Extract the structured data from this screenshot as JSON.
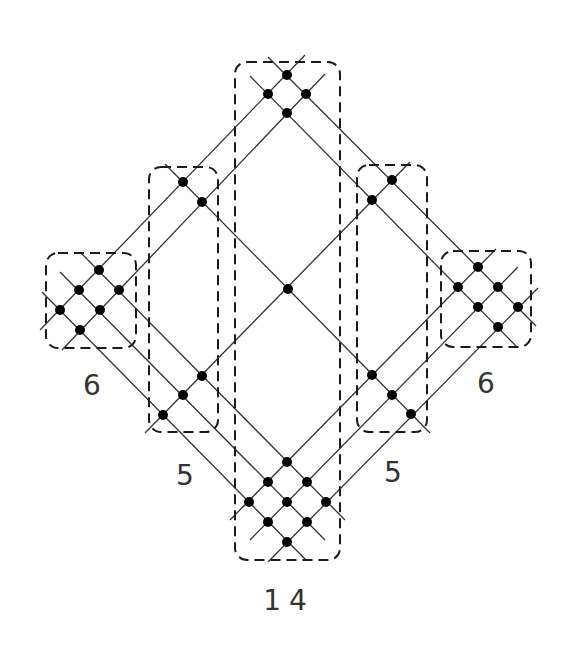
{
  "diagram": {
    "type": "dot-lattice-grouping",
    "colors": {
      "line": "#333333",
      "dot": "#000000",
      "box": "#1a1a1a",
      "label": "#333333",
      "background": "#ffffff"
    },
    "groups": [
      {
        "id": "left-6",
        "label": "6",
        "count": 6,
        "box": {
          "x": 46,
          "y": 253,
          "w": 90,
          "h": 95
        },
        "label_pos": {
          "x": 92,
          "y": 395
        }
      },
      {
        "id": "left-5",
        "label": "5",
        "count": 5,
        "box": {
          "x": 149,
          "y": 167,
          "w": 69,
          "h": 265
        },
        "label_pos": {
          "x": 185,
          "y": 485
        }
      },
      {
        "id": "center-14",
        "label": "14",
        "count": 14,
        "box": {
          "x": 235,
          "y": 62,
          "w": 105,
          "h": 498
        },
        "label_pos": {
          "x": 289,
          "y": 610
        }
      },
      {
        "id": "right-5",
        "label": "5",
        "count": 5,
        "box": {
          "x": 357,
          "y": 165,
          "w": 70,
          "h": 267
        },
        "label_pos": {
          "x": 393,
          "y": 482
        }
      },
      {
        "id": "right-6",
        "label": "6",
        "count": 6,
        "box": {
          "x": 441,
          "y": 251,
          "w": 90,
          "h": 96
        },
        "label_pos": {
          "x": 486,
          "y": 393
        }
      }
    ],
    "dots": [
      [
        287,
        75
      ],
      [
        268,
        94
      ],
      [
        306,
        94
      ],
      [
        287,
        113
      ],
      [
        183,
        182
      ],
      [
        202,
        202
      ],
      [
        392,
        180
      ],
      [
        372,
        200
      ],
      [
        288,
        289
      ],
      [
        99,
        270
      ],
      [
        79,
        290
      ],
      [
        119,
        290
      ],
      [
        60,
        310
      ],
      [
        100,
        310
      ],
      [
        80,
        330
      ],
      [
        478,
        267
      ],
      [
        458,
        287
      ],
      [
        498,
        287
      ],
      [
        478,
        307
      ],
      [
        518,
        307
      ],
      [
        498,
        327
      ],
      [
        202,
        376
      ],
      [
        183,
        395
      ],
      [
        163,
        415
      ],
      [
        372,
        375
      ],
      [
        392,
        395
      ],
      [
        411,
        414
      ],
      [
        287,
        462
      ],
      [
        268,
        482
      ],
      [
        307,
        482
      ],
      [
        249,
        502
      ],
      [
        287,
        502
      ],
      [
        326,
        502
      ],
      [
        268,
        522
      ],
      [
        307,
        522
      ],
      [
        287,
        542
      ]
    ],
    "lines": [
      [
        40,
        330,
        305,
        55
      ],
      [
        62,
        350,
        325,
        74
      ],
      [
        145,
        433,
        410,
        162
      ],
      [
        230,
        520,
        496,
        249
      ],
      [
        250,
        540,
        518,
        267
      ],
      [
        268,
        562,
        538,
        288
      ],
      [
        268,
        57,
        536,
        326
      ],
      [
        250,
        76,
        516,
        346
      ],
      [
        165,
        164,
        430,
        433
      ],
      [
        80,
        252,
        345,
        520
      ],
      [
        60,
        272,
        325,
        540
      ],
      [
        42,
        292,
        306,
        560
      ]
    ]
  }
}
